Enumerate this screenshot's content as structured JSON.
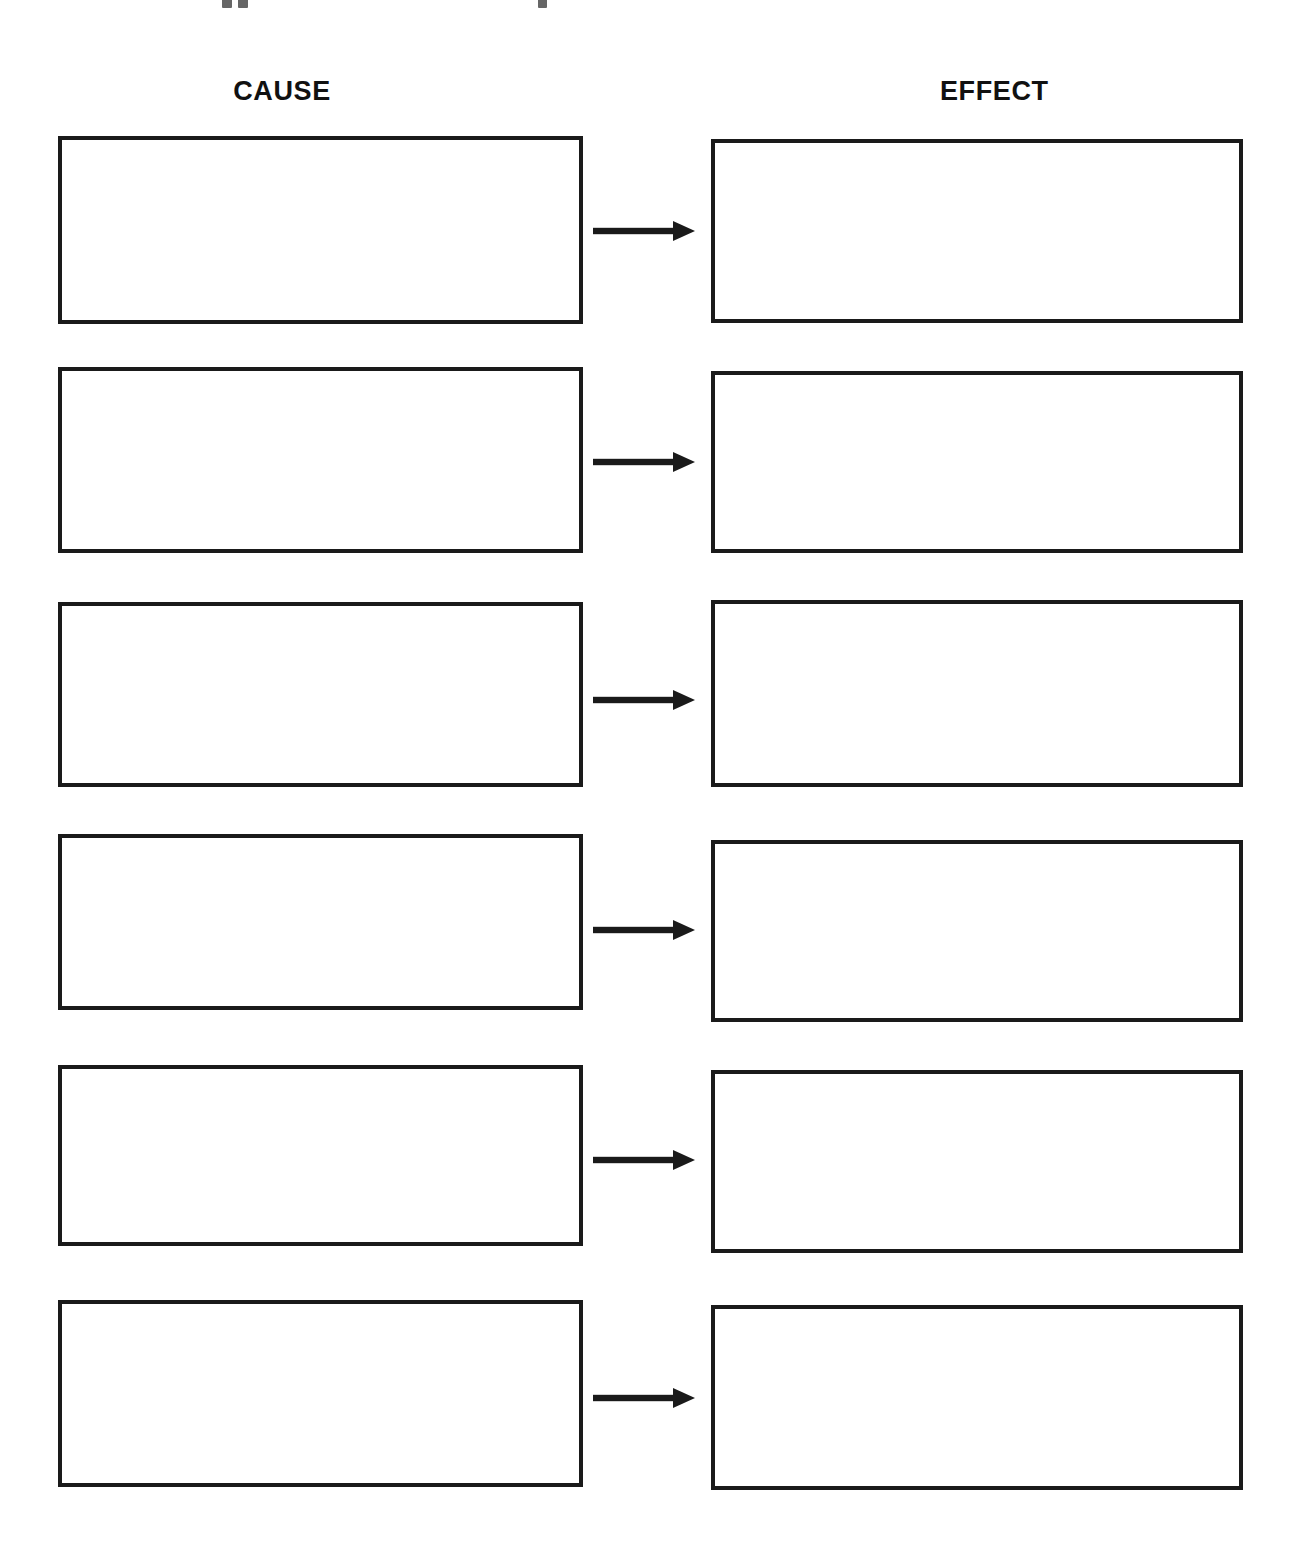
{
  "document": {
    "title": "Cause and Effect Graphic Organizer",
    "page_width": 1305,
    "page_height": 1556,
    "background_color": "#ffffff",
    "ink_color": "#1a1a1a"
  },
  "headers": {
    "cause_label": "CAUSE",
    "effect_label": "EFFECT"
  },
  "rows": [
    {
      "index": 1,
      "cause_text": "",
      "effect_text": "",
      "arrow_label": "",
      "cause_box": {
        "x": 58,
        "y": 136,
        "width": 525,
        "height": 188
      },
      "effect_box": {
        "x": 711,
        "y": 139,
        "width": 532,
        "height": 184
      },
      "arrow": {
        "x": 593,
        "y": 231,
        "length": 102
      }
    },
    {
      "index": 2,
      "cause_text": "",
      "effect_text": "",
      "arrow_label": "",
      "cause_box": {
        "x": 58,
        "y": 367,
        "width": 525,
        "height": 186
      },
      "effect_box": {
        "x": 711,
        "y": 371,
        "width": 532,
        "height": 182
      },
      "arrow": {
        "x": 593,
        "y": 462,
        "length": 102
      }
    },
    {
      "index": 3,
      "cause_text": "",
      "effect_text": "",
      "arrow_label": "",
      "cause_box": {
        "x": 58,
        "y": 602,
        "width": 525,
        "height": 185
      },
      "effect_box": {
        "x": 711,
        "y": 600,
        "width": 532,
        "height": 187
      },
      "arrow": {
        "x": 593,
        "y": 700,
        "length": 102
      }
    },
    {
      "index": 4,
      "cause_text": "",
      "effect_text": "",
      "arrow_label": "",
      "cause_box": {
        "x": 58,
        "y": 834,
        "width": 525,
        "height": 176
      },
      "effect_box": {
        "x": 711,
        "y": 840,
        "width": 532,
        "height": 182
      },
      "arrow": {
        "x": 593,
        "y": 930,
        "length": 102
      }
    },
    {
      "index": 5,
      "cause_text": "",
      "effect_text": "",
      "arrow_label": "",
      "cause_box": {
        "x": 58,
        "y": 1065,
        "width": 525,
        "height": 181
      },
      "effect_box": {
        "x": 711,
        "y": 1070,
        "width": 532,
        "height": 183
      },
      "arrow": {
        "x": 593,
        "y": 1160,
        "length": 102
      }
    },
    {
      "index": 6,
      "cause_text": "",
      "effect_text": "",
      "arrow_label": "",
      "cause_box": {
        "x": 58,
        "y": 1300,
        "width": 525,
        "height": 187
      },
      "effect_box": {
        "x": 711,
        "y": 1305,
        "width": 532,
        "height": 185
      },
      "arrow": {
        "x": 593,
        "y": 1398,
        "length": 102
      }
    }
  ],
  "header_positions": {
    "cause": {
      "x": 232,
      "y": 78,
      "width": 100
    },
    "effect": {
      "x": 940,
      "y": 78,
      "width": 104
    }
  },
  "top_edge_remnants": [
    {
      "x": 222,
      "width": 10
    },
    {
      "x": 238,
      "width": 10
    },
    {
      "x": 538,
      "width": 9
    }
  ]
}
